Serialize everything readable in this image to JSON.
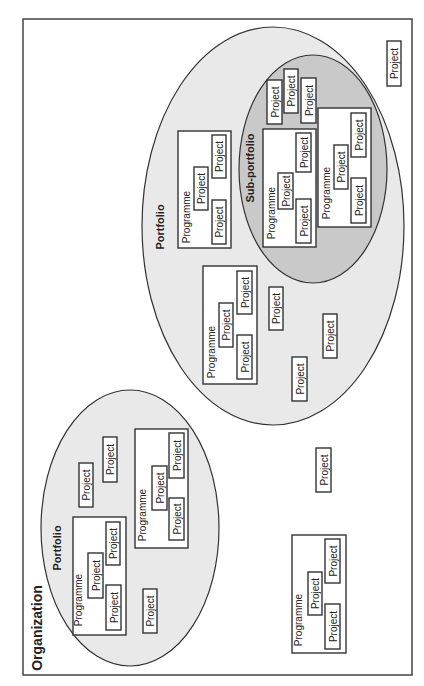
{
  "diagram": {
    "orientation": "rotated-90-ccw",
    "colors": {
      "portfolio_fill": "#e9e9e9",
      "sub_portfolio_fill": "#c9c9c9",
      "box_fill": "#ffffff",
      "stroke": "#333333"
    },
    "organization": {
      "label": "Organization"
    },
    "portfolio_small": {
      "label": "Portfolio",
      "programmes": [
        {
          "label": "Programme",
          "projects": [
            "Project",
            "Project",
            "Project"
          ]
        },
        {
          "label": "Programme",
          "projects": [
            "Project",
            "Project",
            "Project"
          ]
        }
      ],
      "projects": [
        "Project",
        "Project",
        "Project"
      ]
    },
    "portfolio_large": {
      "label": "Portfolio",
      "programmes": [
        {
          "label": "Programme",
          "projects": [
            "Project",
            "Project",
            "Project"
          ]
        },
        {
          "label": "Programme",
          "projects": [
            "Project",
            "Project",
            "Project"
          ]
        }
      ],
      "projects": [
        "Project",
        "Project",
        "Project",
        "Project"
      ],
      "sub_portfolio": {
        "label": "Sub-portfolio",
        "programmes": [
          {
            "label": "Programme",
            "projects": [
              "Project",
              "Project",
              "Project"
            ]
          },
          {
            "label": "Programme",
            "projects": [
              "Project",
              "Project",
              "Project"
            ]
          }
        ],
        "projects": [
          "Project",
          "Project",
          "Project"
        ]
      }
    },
    "standalone": {
      "programme": {
        "label": "Programme",
        "projects": [
          "Project",
          "Project",
          "Project"
        ]
      },
      "projects": [
        "Project",
        "Project"
      ]
    }
  }
}
